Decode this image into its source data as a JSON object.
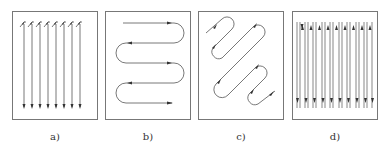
{
  "figure": {
    "panels": [
      {
        "id": "a",
        "label": "a)",
        "description": "Parallel unidirectional raster strokes, all top-to-bottom, with return marks at top",
        "stroke_count": 8
      },
      {
        "id": "b",
        "label": "b)",
        "description": "Horizontal boustrophedon (serpentine) path with rounded U-turns",
        "passes": 5
      },
      {
        "id": "c",
        "label": "c)",
        "description": "Diagonal serpentine zig-zag path with rounded turns"
      },
      {
        "id": "d",
        "label": "d)",
        "description": "Parallel bidirectional strokes with arrowheads at both ends",
        "stroke_count": 12
      }
    ],
    "colors": {
      "line": "#555555",
      "frame": "#777777",
      "background": "#ffffff"
    }
  }
}
